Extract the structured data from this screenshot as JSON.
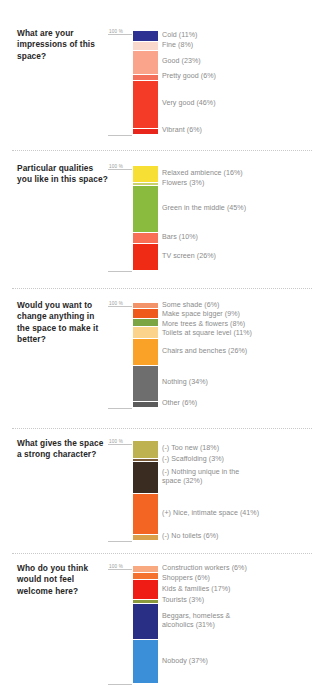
{
  "meta": {
    "axis_tick_label": "100 %",
    "bar_max_percent": 100
  },
  "sections": [
    {
      "id": "impressions",
      "question": "What are your impressions of this space?",
      "axis_label": "100 %",
      "chart_data": {
        "type": "bar",
        "subtype": "stacked-100",
        "title": "What are your impressions of this space?",
        "xlabel": "",
        "ylabel": "",
        "ylim": [
          0,
          100
        ],
        "grid": false,
        "legend": "right-inline",
        "categories": [
          "Cold",
          "Fine",
          "Good",
          "Pretty good",
          "Very good",
          "Vibrant"
        ],
        "values": [
          11,
          8,
          23,
          6,
          46,
          6
        ],
        "labels": [
          "Cold (11%)",
          "Fine (8%)",
          "Good (23%)",
          "Pretty good (6%)",
          "Very good (46%)",
          "Vibrant (6%)"
        ],
        "colors": [
          "#2e3192",
          "#fbd8cc",
          "#f9a48b",
          "#f4705a",
          "#f33b28",
          "#e8261c"
        ]
      }
    },
    {
      "id": "qualities",
      "question": "Particular qualities you like in this space?",
      "axis_label": "100 %",
      "chart_data": {
        "type": "bar",
        "subtype": "stacked-100",
        "title": "Particular qualities you like in this space?",
        "xlabel": "",
        "ylabel": "",
        "ylim": [
          0,
          100
        ],
        "grid": false,
        "legend": "right-inline",
        "categories": [
          "Relaxed ambience",
          "Flowers",
          "Green in the middle",
          "Bars",
          "TV screen"
        ],
        "values": [
          16,
          3,
          45,
          10,
          26
        ],
        "labels": [
          "Relaxed ambience (16%)",
          "Flowers (3%)",
          "Green in the middle (45%)",
          "Bars (10%)",
          "TV screen (26%)"
        ],
        "colors": [
          "#f7e033",
          "#c9d36a",
          "#8aba3e",
          "#f96f56",
          "#ef2b15"
        ]
      }
    },
    {
      "id": "change",
      "question": "Would you want to change anything in the space to make it better?",
      "axis_label": "100 %",
      "chart_data": {
        "type": "bar",
        "subtype": "stacked-100",
        "title": "Would you want to change anything in the space to make it better?",
        "xlabel": "",
        "ylabel": "",
        "ylim": [
          0,
          100
        ],
        "grid": false,
        "legend": "right-inline",
        "categories": [
          "Some shade",
          "Make space bigger",
          "More trees & flowers",
          "Toilets at square level",
          "Chairs and benches",
          "Nothing",
          "Other"
        ],
        "values": [
          6,
          9,
          8,
          11,
          26,
          34,
          6
        ],
        "labels": [
          "Some shade (6%)",
          "Make space bigger (9%)",
          "More trees & flowers (8%)",
          "Toilets at square level (11%)",
          "Chairs and benches (26%)",
          "Nothing (34%)",
          "Other (6%)"
        ],
        "colors": [
          "#f2936a",
          "#ef5919",
          "#7ba542",
          "#fbd38b",
          "#f9a227",
          "#6e6e6e",
          "#5b5b5b"
        ]
      }
    },
    {
      "id": "character",
      "question": "What gives the space a strong character?",
      "axis_label": "100 %",
      "chart_data": {
        "type": "bar",
        "subtype": "stacked-100",
        "title": "What gives the space a strong character?",
        "xlabel": "",
        "ylabel": "",
        "ylim": [
          0,
          100
        ],
        "grid": false,
        "legend": "right-inline",
        "categories": [
          "(-) Too new",
          "(-) Scaffolding",
          "(-) Nothing unique in the space",
          "(+) Nice, intimate space",
          "(-) No toilets"
        ],
        "values": [
          18,
          3,
          32,
          41,
          6
        ],
        "labels": [
          "(-) Too new (18%)",
          "(-) Scaffolding  (3%)",
          "(-) Nothing unique in the\nspace (32%)",
          "(+) Nice, intimate space (41%)",
          "(-) No toilets (6%)"
        ],
        "colors": [
          "#bdb24f",
          "#7a5c3a",
          "#3a2c20",
          "#f26522",
          "#d9a24a"
        ]
      }
    },
    {
      "id": "welcome",
      "question": "Who do you think would not feel welcome here?",
      "axis_label": "100 %",
      "chart_data": {
        "type": "bar",
        "subtype": "stacked-100",
        "title": "Who do you think would not feel welcome here?",
        "xlabel": "",
        "ylabel": "",
        "ylim": [
          0,
          100
        ],
        "grid": false,
        "legend": "right-inline",
        "categories": [
          "Construction workers",
          "Shoppers",
          "Kids & families",
          "Tourists",
          "Beggars, homeless & alcoholics",
          "Nobody"
        ],
        "values": [
          6,
          6,
          17,
          3,
          31,
          37
        ],
        "labels": [
          "Construction workers (6%)",
          "Shoppers (6%)",
          "Kids & families (17%)",
          "Tourists (3%)",
          "Beggars, homeless &\nalcoholics (31%)",
          "Nobody (37%)"
        ],
        "colors": [
          "#f8a97f",
          "#f4712e",
          "#ee1c15",
          "#8a9a3c",
          "#2a2f86",
          "#3b8fd9"
        ]
      }
    }
  ]
}
